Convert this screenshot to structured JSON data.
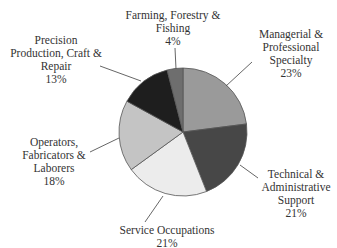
{
  "chart_data": {
    "type": "pie",
    "title": "",
    "slices": [
      {
        "label": [
          "Managerial &",
          "Professional",
          "Specialty"
        ],
        "value": 23,
        "pct_label": "23%",
        "color": "#9a9a9a"
      },
      {
        "label": [
          "Technical &",
          "Administrative",
          "Support"
        ],
        "value": 21,
        "pct_label": "21%",
        "color": "#474747"
      },
      {
        "label": [
          "Service Occupations"
        ],
        "value": 21,
        "pct_label": "21%",
        "color": "#ececec"
      },
      {
        "label": [
          "Operators,",
          "Fabricators &",
          "Laborers"
        ],
        "value": 18,
        "pct_label": "18%",
        "color": "#c4c4c4"
      },
      {
        "label": [
          "Precision",
          "Production, Craft &",
          "Repair"
        ],
        "value": 13,
        "pct_label": "13%",
        "color": "#1e1e1e"
      },
      {
        "label": [
          "Farming, Forestry &",
          "Fishing"
        ],
        "value": 4,
        "pct_label": "4%",
        "color": "#6e6e6e"
      }
    ],
    "start_angle": "top",
    "direction": "clockwise",
    "legend": "none"
  }
}
